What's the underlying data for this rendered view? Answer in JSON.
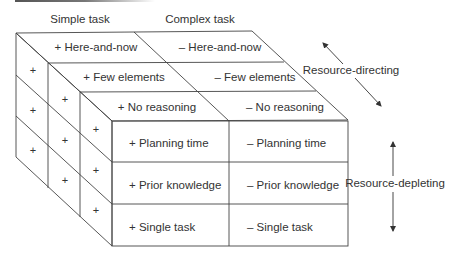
{
  "diagram": {
    "column_headers": [
      "Simple task",
      "Complex task"
    ],
    "top_face_rows": [
      {
        "simple": "+ Here-and-now",
        "complex": "– Here-and-now"
      },
      {
        "simple": "+ Few elements",
        "complex": "– Few elements"
      },
      {
        "simple": "+ No reasoning",
        "complex": "– No reasoning"
      }
    ],
    "front_face_rows": [
      {
        "simple": "+ Planning time",
        "complex": "– Planning time"
      },
      {
        "simple": "+ Prior knowledge",
        "complex": "– Prior knowledge"
      },
      {
        "simple": "+ Single task",
        "complex": "– Single task"
      }
    ],
    "side_face_symbol": "+",
    "axes": {
      "resource_directing": "Resource-directing",
      "resource_depleting": "Resource-depleting"
    }
  }
}
